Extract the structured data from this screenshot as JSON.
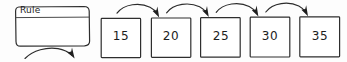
{
  "diagram": {
    "type": "number-sequence-rule-worksheet",
    "rule_box": {
      "label": "Rule",
      "body_value": "",
      "has_divider": true,
      "arrow_out": "curved-arrow-down-right"
    },
    "sequence": {
      "boxes": [
        {
          "value": "15"
        },
        {
          "value": "20"
        },
        {
          "value": "25"
        },
        {
          "value": "30"
        },
        {
          "value": "35"
        }
      ],
      "connectors": [
        {
          "from": "15",
          "to": "20",
          "style": "curved-arrow-right"
        },
        {
          "from": "20",
          "to": "25",
          "style": "curved-arrow-right"
        },
        {
          "from": "25",
          "to": "30",
          "style": "curved-arrow-right"
        },
        {
          "from": "30",
          "to": "35",
          "style": "curved-arrow-right"
        }
      ]
    },
    "colors": {
      "background": "#fdfdfd",
      "stroke": "#2b2b2b",
      "text": "#1c1c1c",
      "box_fill": "#ffffff"
    }
  }
}
